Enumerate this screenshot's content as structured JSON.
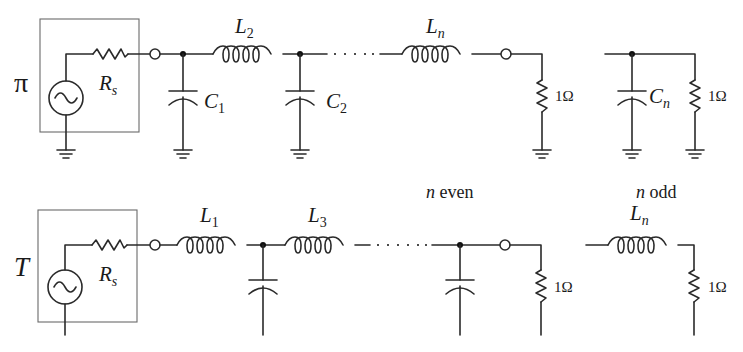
{
  "diagram": {
    "type": "ladder-filter-prototypes",
    "pi_network": {
      "label": "π",
      "source_resistor": {
        "symbol": "R",
        "subscript": "s"
      },
      "components": [
        {
          "type": "capacitor",
          "symbol": "C",
          "subscript": "1"
        },
        {
          "type": "inductor",
          "symbol": "L",
          "subscript": "2"
        },
        {
          "type": "capacitor",
          "symbol": "C",
          "subscript": "2"
        },
        {
          "type": "inductor",
          "symbol": "L",
          "subscript": "n"
        }
      ],
      "load_even": "1Ω",
      "odd_ending": {
        "capacitor": {
          "symbol": "C",
          "subscript": "n"
        },
        "load": "1Ω"
      }
    },
    "t_network": {
      "label": "T",
      "source_resistor": {
        "symbol": "R",
        "subscript": "s"
      },
      "components": [
        {
          "type": "inductor",
          "symbol": "L",
          "subscript": "1"
        },
        {
          "type": "capacitor",
          "symbol": "",
          "subscript": ""
        },
        {
          "type": "inductor",
          "symbol": "L",
          "subscript": "3"
        },
        {
          "type": "capacitor",
          "symbol": "",
          "subscript": ""
        }
      ],
      "load_even": "1Ω",
      "odd_ending": {
        "inductor": {
          "symbol": "L",
          "subscript": "n"
        },
        "load": "1Ω"
      }
    },
    "notes": {
      "even": "n even",
      "even_n": "n",
      "even_word": "even",
      "odd": "n odd",
      "odd_n": "n",
      "odd_word": "odd"
    }
  }
}
